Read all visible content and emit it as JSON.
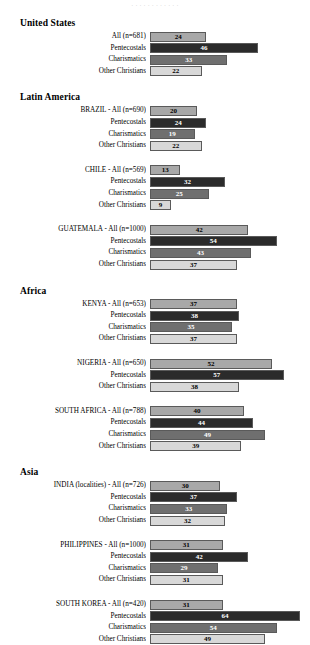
{
  "top_partial_text": "· · ·   · · ·   · · ·   · · ·",
  "groups": {
    "all": "All",
    "pentecostals": "Pentecostals",
    "charismatics": "Charismatics",
    "other": "Other Christians"
  },
  "colors": {
    "all": "#a8a8a8",
    "pentecostals": "#2b2b2b",
    "charismatics": "#6f6f6f",
    "other": "#d8d8d8",
    "bar_border": "#5a5a5a",
    "text": "#000000"
  },
  "chart_data": {
    "type": "bar",
    "orientation": "horizontal",
    "title": "",
    "xlabel": "",
    "ylabel": "",
    "xlim": [
      0,
      64
    ],
    "grid": false,
    "legend": "none",
    "series": [
      {
        "name": "All",
        "key": "all"
      },
      {
        "name": "Pentecostals",
        "key": "pentecostals"
      },
      {
        "name": "Charismatics",
        "key": "charismatics"
      },
      {
        "name": "Other Christians",
        "key": "other"
      }
    ],
    "regions": [
      {
        "region": "United States",
        "blocks": [
          {
            "rows": [
              {
                "label": "All (n=681)",
                "group": "all",
                "value": 24
              },
              {
                "label": "Pentecostals",
                "group": "pentecostals",
                "value": 46
              },
              {
                "label": "Charismatics",
                "group": "charismatics",
                "value": 33
              },
              {
                "label": "Other Christians",
                "group": "other",
                "value": 22
              }
            ]
          }
        ]
      },
      {
        "region": "Latin America",
        "blocks": [
          {
            "rows": [
              {
                "label": "BRAZIL - All (n=690)",
                "group": "all",
                "value": 20
              },
              {
                "label": "Pentecostals",
                "group": "pentecostals",
                "value": 24
              },
              {
                "label": "Charismatics",
                "group": "charismatics",
                "value": 19
              },
              {
                "label": "Other Christians",
                "group": "other",
                "value": 22
              }
            ]
          },
          {
            "rows": [
              {
                "label": "CHILE - All (n=569)",
                "group": "all",
                "value": 13
              },
              {
                "label": "Pentecostals",
                "group": "pentecostals",
                "value": 32
              },
              {
                "label": "Charismatics",
                "group": "charismatics",
                "value": 25
              },
              {
                "label": "Other Christians",
                "group": "other",
                "value": 9
              }
            ]
          },
          {
            "rows": [
              {
                "label": "GUATEMALA - All (n=1000)",
                "group": "all",
                "value": 42
              },
              {
                "label": "Pentecostals",
                "group": "pentecostals",
                "value": 54
              },
              {
                "label": "Charismatics",
                "group": "charismatics",
                "value": 43
              },
              {
                "label": "Other Christians",
                "group": "other",
                "value": 37
              }
            ]
          }
        ]
      },
      {
        "region": "Africa",
        "blocks": [
          {
            "rows": [
              {
                "label": "KENYA - All (n=653)",
                "group": "all",
                "value": 37
              },
              {
                "label": "Pentecostals",
                "group": "pentecostals",
                "value": 38
              },
              {
                "label": "Charismatics",
                "group": "charismatics",
                "value": 35
              },
              {
                "label": "Other Christians",
                "group": "other",
                "value": 37
              }
            ]
          },
          {
            "rows": [
              {
                "label": "NIGERIA - All (n=650)",
                "group": "all",
                "value": 52
              },
              {
                "label": "Pentecostals",
                "group": "pentecostals",
                "value": 57
              },
              {
                "label": "Other Christians",
                "group": "other",
                "value": 38
              }
            ]
          },
          {
            "rows": [
              {
                "label": "SOUTH AFRICA - All (n=788)",
                "group": "all",
                "value": 40
              },
              {
                "label": "Pentecostals",
                "group": "pentecostals",
                "value": 44
              },
              {
                "label": "Charismatics",
                "group": "charismatics",
                "value": 49
              },
              {
                "label": "Other Christians",
                "group": "other",
                "value": 39
              }
            ]
          }
        ]
      },
      {
        "region": "Asia",
        "blocks": [
          {
            "rows": [
              {
                "label": "INDIA (localities) - All (n=726)",
                "group": "all",
                "value": 30
              },
              {
                "label": "Pentecostals",
                "group": "pentecostals",
                "value": 37
              },
              {
                "label": "Charismatics",
                "group": "charismatics",
                "value": 33
              },
              {
                "label": "Other Christians",
                "group": "other",
                "value": 32
              }
            ]
          },
          {
            "rows": [
              {
                "label": "PHILIPPINES - All (n=1000)",
                "group": "all",
                "value": 31
              },
              {
                "label": "Pentecostals",
                "group": "pentecostals",
                "value": 42
              },
              {
                "label": "Charismatics",
                "group": "charismatics",
                "value": 29
              },
              {
                "label": "Other Christians",
                "group": "other",
                "value": 31
              }
            ]
          },
          {
            "rows": [
              {
                "label": "SOUTH KOREA - All (n=420)",
                "group": "all",
                "value": 31
              },
              {
                "label": "Pentecostals",
                "group": "pentecostals",
                "value": 64
              },
              {
                "label": "Charismatics",
                "group": "charismatics",
                "value": 54
              },
              {
                "label": "Other Christians",
                "group": "other",
                "value": 49
              }
            ]
          }
        ]
      }
    ]
  }
}
